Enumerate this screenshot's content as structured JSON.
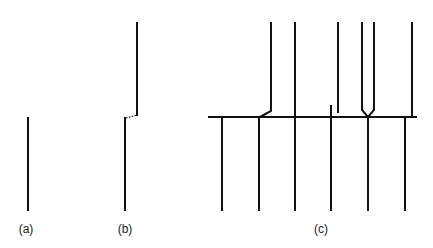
{
  "figure": {
    "panels": [
      {
        "id": "a",
        "label": "(a)",
        "label_x": 26,
        "label_y": 222
      },
      {
        "id": "b",
        "label": "(b)",
        "label_x": 125,
        "label_y": 222
      },
      {
        "id": "c",
        "label": "(c)",
        "label_x": 321,
        "label_y": 222
      }
    ],
    "stroke_color": "#111111"
  }
}
